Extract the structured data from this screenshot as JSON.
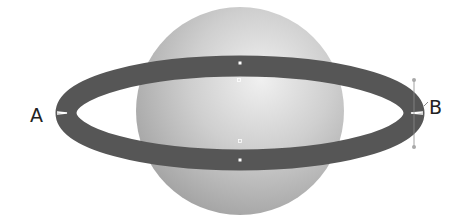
{
  "diagram": {
    "labels": {
      "left": "A",
      "right": "B"
    },
    "colors": {
      "background": "#ffffff",
      "sphere_light": "#e6e6e6",
      "sphere_mid": "#bdbdbd",
      "sphere_dark": "#9a9a9a",
      "ring": "#565656",
      "ring_dark": "#4a4a4a",
      "anchor_point": "#ffffff",
      "label_text": "#222222"
    },
    "sphere": {
      "cx": 240,
      "cy": 111,
      "r": 104
    },
    "ring": {
      "cx": 240,
      "cy": 113,
      "rx": 174,
      "ry": 47,
      "stroke_width": 20
    },
    "anchor_points": [
      {
        "name": "ring-top-point",
        "x": 240,
        "y": 63,
        "style": "filled"
      },
      {
        "name": "center-top-point",
        "x": 239,
        "y": 80,
        "style": "hollow"
      },
      {
        "name": "center-bottom-point",
        "x": 240,
        "y": 141,
        "style": "hollow"
      },
      {
        "name": "ring-bottom-point",
        "x": 240,
        "y": 160,
        "style": "filled"
      }
    ],
    "handles": [
      {
        "name": "handle-b-top",
        "x": 414,
        "y": 80
      },
      {
        "name": "handle-b-bottom",
        "x": 414,
        "y": 147
      }
    ]
  }
}
